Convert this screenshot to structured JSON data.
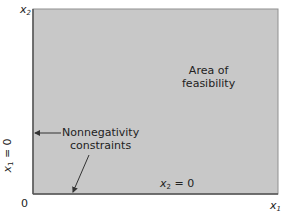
{
  "diagram": {
    "region_fill": "#c8c8c8",
    "region_border": "#888888",
    "axis_color": "#555555",
    "labels": {
      "y_axis": "x",
      "y_axis_sub": "2",
      "x_axis": "x",
      "x_axis_sub": "1",
      "origin": "0",
      "area_line1": "Area of",
      "area_line2": "feasibility",
      "constraint_line1": "Nonnegativity",
      "constraint_line2": "constraints",
      "x2_zero_var": "x",
      "x2_zero_sub": "2",
      "x2_zero_rest": " = 0",
      "x1_zero_var": "x",
      "x1_zero_sub": "1",
      "x1_zero_rest": " = 0"
    }
  }
}
